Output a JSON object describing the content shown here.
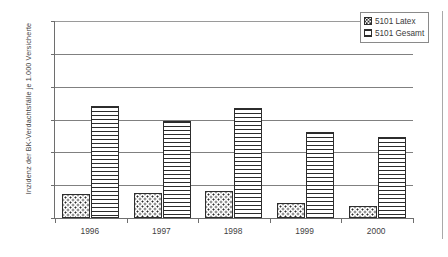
{
  "chart_data": {
    "type": "bar",
    "title": "",
    "subtitle": "",
    "xlabel": "",
    "ylabel": "Inzidenz der BK-Verdachtsfälle je 1.000 Versicherte",
    "categories": [
      "1996",
      "1997",
      "1998",
      "1999",
      "2000"
    ],
    "series": [
      {
        "name": "5101 Latex",
        "pattern": "dotted",
        "values": [
          0.36,
          0.38,
          0.41,
          0.23,
          0.18
        ]
      },
      {
        "name": "5101 Gesamt",
        "pattern": "horizontal-lines",
        "values": [
          1.71,
          1.47,
          1.68,
          1.31,
          1.23
        ]
      }
    ],
    "ylim": [
      0,
      3
    ],
    "ytick_values": [
      0,
      0.5,
      1,
      1.5,
      2,
      2.5,
      3
    ],
    "ytick_labels": [
      "0",
      "0,5",
      "1",
      "1,5",
      "2",
      "2,5",
      "3"
    ],
    "grid": true,
    "grid_axis": "y",
    "legend_position": "top-right",
    "colors": {
      "axis": "#6e6e6e",
      "gridline": "#808080",
      "bar_outline": "#2d2d2d",
      "pattern": "#2b2b2b",
      "text": "#3f3f3f",
      "background": "#ffffff"
    }
  },
  "legend": {
    "items": [
      {
        "label": "5101 Latex",
        "swatch": "dotted-swatch"
      },
      {
        "label": "5101 Gesamt",
        "swatch": "hlines-swatch"
      }
    ]
  }
}
